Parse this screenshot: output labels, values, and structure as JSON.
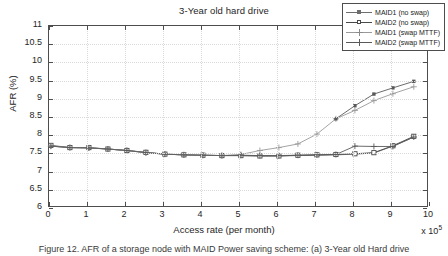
{
  "figure": {
    "title": "3-Year old hard drive",
    "caption": "Figure 12.  AFR of a storage node with MAID Power saving scheme: (a) 3-Year old Hard drive"
  },
  "axes": {
    "xlabel": "Access rate (per month)",
    "ylabel": "AFR (%)",
    "x_exponent_prefix": "x 10",
    "x_exponent": "5",
    "xlim": [
      0,
      10
    ],
    "ylim": [
      6,
      11
    ],
    "xticks": [
      0,
      1,
      2,
      3,
      4,
      5,
      6,
      7,
      8,
      9,
      10
    ],
    "yticks": [
      6,
      6.5,
      7,
      7.5,
      8,
      8.5,
      9,
      9.5,
      10,
      10.5,
      11
    ],
    "xticklabels": [
      "0",
      "1",
      "2",
      "3",
      "4",
      "5",
      "6",
      "7",
      "8",
      "9",
      "10"
    ],
    "yticklabels": [
      "6",
      "6.5",
      "7",
      "7.5",
      "8",
      "8.5",
      "9",
      "9.5",
      "10",
      "10.5",
      "11"
    ],
    "grid": true
  },
  "legend": {
    "position": "top-right",
    "entries": [
      {
        "label": "MAID1 (no swap)",
        "marker": "filled-square",
        "color": "#6e6e6e"
      },
      {
        "label": "MAID2 (no swap)",
        "marker": "open-square",
        "color": "#4a4a4a"
      },
      {
        "label": "MAID1 (swap MTTF)",
        "marker": "plus",
        "color": "#9a9a9a"
      },
      {
        "label": "MAID2 (swap MTTF)",
        "marker": "plus",
        "color": "#5a5a5a"
      }
    ]
  },
  "chart_data": {
    "type": "line",
    "title": "3-Year old hard drive",
    "xlabel": "Access rate (per month)",
    "ylabel": "AFR (%)",
    "xlim": [
      0,
      10
    ],
    "ylim": [
      6,
      11
    ],
    "x_multiplier": "1e5",
    "grid": true,
    "legend_position": "top-right",
    "x": [
      0.05,
      0.55,
      1.05,
      1.55,
      2.05,
      2.55,
      3.05,
      3.55,
      4.05,
      4.55,
      5.05,
      5.55,
      6.05,
      6.55,
      7.05,
      7.55,
      8.05,
      8.55,
      9.05,
      9.6
    ],
    "series": [
      {
        "name": "MAID1 (no swap)",
        "marker": "filled-square",
        "color": "#6e6e6e",
        "values": [
          7.7,
          7.66,
          7.65,
          7.62,
          7.58,
          7.52,
          7.48,
          7.46,
          7.45,
          7.44,
          7.44,
          7.43,
          7.43,
          7.44,
          7.45,
          7.46,
          7.48,
          7.51,
          7.7,
          7.95
        ]
      },
      {
        "name": "MAID2 (no swap)",
        "marker": "open-square",
        "color": "#4a4a4a",
        "values": [
          7.72,
          7.66,
          7.66,
          7.62,
          7.58,
          7.53,
          7.48,
          7.46,
          7.45,
          7.44,
          7.44,
          7.43,
          7.43,
          7.45,
          7.46,
          7.47,
          7.49,
          7.52,
          7.71,
          7.97
        ]
      },
      {
        "name": "MAID1 (swap MTTF)",
        "marker": "plus",
        "color": "#9a9a9a",
        "values": [
          7.7,
          7.66,
          7.65,
          7.62,
          7.58,
          7.52,
          7.48,
          7.46,
          7.45,
          7.44,
          7.47,
          7.58,
          7.66,
          7.76,
          8.03,
          8.45,
          8.68,
          8.95,
          9.14,
          9.33
        ]
      },
      {
        "name": "MAID2 (swap MTTF)",
        "marker": "plus",
        "color": "#5a5a5a",
        "values": [
          7.7,
          7.66,
          7.65,
          7.62,
          7.58,
          7.52,
          7.48,
          7.46,
          7.45,
          7.44,
          7.45,
          7.44,
          7.44,
          7.45,
          7.46,
          7.47,
          7.7,
          7.69,
          7.69,
          7.95
        ]
      },
      {
        "name": "MAID2 (swap MTTF) upper",
        "marker": "filled-square",
        "color": "#5a5a5a",
        "x": [
          7.55,
          8.05,
          8.55,
          9.05,
          9.6
        ],
        "values": [
          8.45,
          8.81,
          9.13,
          9.3,
          9.48
        ]
      }
    ]
  }
}
